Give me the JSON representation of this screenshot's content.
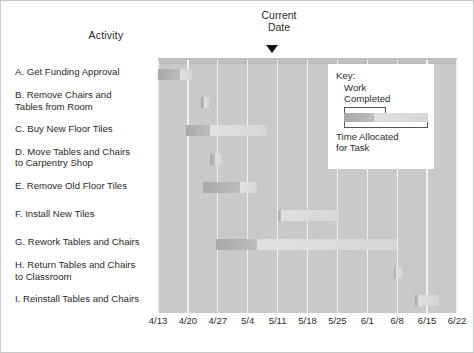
{
  "headers": {
    "activity": "Activity",
    "current_date_line1": "Current",
    "current_date_line2": "Date",
    "marker_icon": "triangle-down-marker"
  },
  "key": {
    "title": "Key:",
    "work_line1": "Work",
    "work_line2": "Completed",
    "time_line1": "Time Allocated",
    "time_line2": "for Task"
  },
  "chart_data": {
    "type": "bar",
    "chart_subtype": "gantt",
    "title": "",
    "xlabel": "",
    "ylabel": "Activity",
    "grid": true,
    "legend_position": "inside-top-right",
    "colors": {
      "plot_background": "#c9c9c9",
      "gridline": "#f2f2f2",
      "work_completed": "#a8a8a8",
      "time_allocated": "#e0e0e0",
      "text": "#2b2b2b",
      "marker": "#111111",
      "page_background": "#ffffff"
    },
    "x_axis": {
      "tick_labels": [
        "4/13",
        "4/20",
        "4/27",
        "5/4",
        "5/11",
        "5/18",
        "5/25",
        "6/1",
        "6/8",
        "6/15",
        "6/22"
      ],
      "tick_positions_pct": [
        0,
        10,
        20,
        30,
        40,
        50,
        60,
        70,
        80,
        90,
        100
      ],
      "range_start": "4/13",
      "range_end": "6/22",
      "unit": "week"
    },
    "current_date": {
      "label": "Current Date",
      "value": "5/11",
      "position_pct": 40
    },
    "categories": [
      "A. Get Funding Approval",
      "B. Remove Chairs and Tables from Room",
      "C. Buy New Floor Tiles",
      "D. Move Tables and Chairs to Carpentry Shop",
      "E. Remove Old Floor Tiles",
      "F. Install New Tiles",
      "G. Rework Tables and Chairs",
      "H. Return Tables and Chairs to Classroom",
      "I. Reinstall Tables and Chairs"
    ],
    "tasks": [
      {
        "id": "A",
        "label_line1": "A. Get Funding Approval",
        "label_line2": "",
        "start_pct": 0,
        "completed_end_pct": 7.5,
        "end_pct": 11.5,
        "start_date": "4/13",
        "completed_through": "4/18",
        "end_date": "4/21"
      },
      {
        "id": "B",
        "label_line1": "B. Remove Chairs and",
        "label_line2": "Tables from Room",
        "start_pct": 14.5,
        "completed_end_pct": 15.5,
        "end_pct": 17.0,
        "start_date": "4/23",
        "completed_through": "4/24",
        "end_date": "4/25"
      },
      {
        "id": "C",
        "label_line1": "C. Buy New Floor Tiles",
        "label_line2": "",
        "start_pct": 9.5,
        "completed_end_pct": 17.5,
        "end_pct": 36.5,
        "start_date": "4/20",
        "completed_through": "4/25",
        "end_date": "5/9"
      },
      {
        "id": "D",
        "label_line1": "D. Move Tables and Chairs",
        "label_line2": "to Carpentry Shop",
        "start_pct": 17.5,
        "completed_end_pct": 19.0,
        "end_pct": 21.5,
        "start_date": "4/25",
        "completed_through": "4/26",
        "end_date": "4/28"
      },
      {
        "id": "E",
        "label_line1": "E. Remove Old Floor Tiles",
        "label_line2": "",
        "start_pct": 15.0,
        "completed_end_pct": 27.5,
        "end_pct": 33.0,
        "start_date": "4/24",
        "completed_through": "5/2",
        "end_date": "5/6"
      },
      {
        "id": "F",
        "label_line1": "F. Install New Tiles",
        "label_line2": "",
        "start_pct": 40.0,
        "completed_end_pct": 41.0,
        "end_pct": 60.5,
        "start_date": "5/11",
        "completed_through": "5/12",
        "end_date": "5/25"
      },
      {
        "id": "G",
        "label_line1": "G. Rework Tables and Chairs",
        "label_line2": "",
        "start_pct": 19.5,
        "completed_end_pct": 33.0,
        "end_pct": 80.0,
        "start_date": "4/26",
        "completed_through": "5/6",
        "end_date": "6/8"
      },
      {
        "id": "H",
        "label_line1": "H. Return Tables and Chairs",
        "label_line2": "to Classroom",
        "start_pct": 79.0,
        "completed_end_pct": 79.5,
        "end_pct": 81.5,
        "start_date": "6/7",
        "completed_through": "6/7",
        "end_date": "6/9"
      },
      {
        "id": "I",
        "label_line1": "I.  Reinstall Tables and Chairs",
        "label_line2": "",
        "start_pct": 86.0,
        "completed_end_pct": 87.0,
        "end_pct": 94.0,
        "start_date": "6/13",
        "completed_through": "6/13",
        "end_date": "6/18"
      }
    ]
  }
}
